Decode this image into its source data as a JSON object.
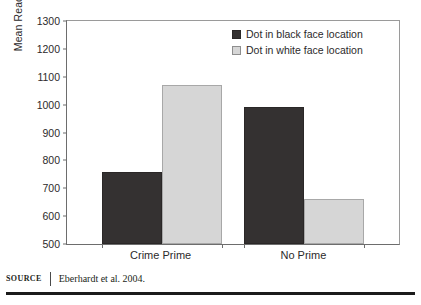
{
  "chart_data": {
    "type": "bar",
    "title": "",
    "subtitle": "",
    "xlabel": "",
    "ylabel": "Mean Reaction (ms)",
    "categories": [
      "Crime Prime",
      "No Prime"
    ],
    "series": [
      {
        "name": "Dot in black face location",
        "color": "#343131",
        "values": [
          757,
          991
        ]
      },
      {
        "name": "Dot in white face location",
        "color": "#d6d6d6",
        "values": [
          1069,
          661
        ]
      }
    ],
    "ylim": [
      500,
      1300
    ],
    "yticks": [
      500,
      600,
      700,
      800,
      900,
      1000,
      1100,
      1200,
      1300
    ],
    "ytick_labels": [
      "500",
      "600",
      "700",
      "800",
      "900",
      "1000",
      "1100",
      "1200",
      "1300"
    ],
    "grid": false,
    "legend_position": "top-right"
  },
  "legend": {
    "entries": [
      {
        "label": "Dot in black face location",
        "swatch": "dark"
      },
      {
        "label": "Dot in white face location",
        "swatch": "light"
      }
    ]
  },
  "source": {
    "tag": "SOURCE",
    "text": "Eberhardt et al. 2004."
  }
}
